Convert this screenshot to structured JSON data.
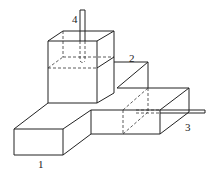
{
  "diagram": {
    "type": "isometric line drawing of connected tanks",
    "labels": [
      {
        "id": "1",
        "text": "1",
        "x": 38,
        "y": 168
      },
      {
        "id": "2",
        "text": "2",
        "x": 129,
        "y": 62
      },
      {
        "id": "3",
        "text": "3",
        "x": 185,
        "y": 131
      },
      {
        "id": "4",
        "text": "4",
        "x": 72,
        "y": 23
      }
    ],
    "components": [
      {
        "id": "tall-tank",
        "description": "upper box with liquid level (dashed)"
      },
      {
        "id": "step-block",
        "description": "stepped middle block"
      },
      {
        "id": "left-block",
        "description": "lower-left rectangular block"
      },
      {
        "id": "right-block",
        "description": "lower-right box with outlet pipe"
      },
      {
        "id": "pipe-4",
        "description": "vertical pipe into tall tank"
      },
      {
        "id": "pipe-3",
        "description": "horizontal outlet pipe"
      }
    ]
  }
}
